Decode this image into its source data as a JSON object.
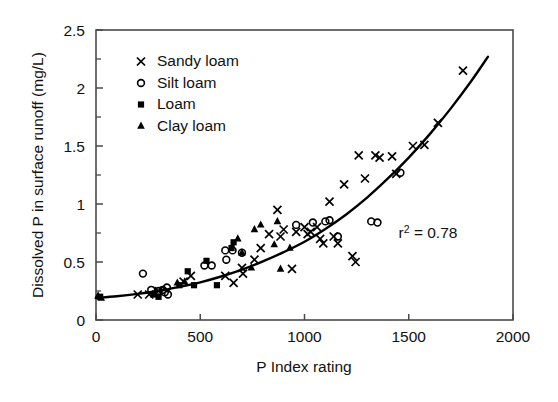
{
  "chart_data": {
    "type": "scatter",
    "title": "",
    "xlabel": "P Index rating",
    "ylabel": "Dissolved P in surface runoff (mg/L)",
    "xlim": [
      0,
      2000
    ],
    "ylim": [
      0,
      2.5
    ],
    "xticks": [
      0,
      500,
      1000,
      1500,
      2000
    ],
    "xtick_labels": [
      "0",
      "500",
      "1000",
      "1500",
      "2000"
    ],
    "yticks": [
      0,
      0.5,
      1,
      1.5,
      2,
      2.5
    ],
    "ytick_labels": [
      "0",
      "0.5",
      "1",
      "1.5",
      "2",
      "2.5"
    ],
    "yticks_minor": [
      0.25,
      0.75,
      1.25,
      1.75,
      2.25
    ],
    "grid": false,
    "legend_position": "upper-left-inside",
    "annotations": [
      {
        "text": "r2 = 0.78",
        "display": "r",
        "sup": "2",
        "rest": " = 0.78",
        "x": 1600,
        "y": 0.72
      }
    ],
    "series": [
      {
        "name": "Sandy loam",
        "marker": "cross",
        "points": [
          [
            200,
            0.22
          ],
          [
            255,
            0.22
          ],
          [
            300,
            0.25
          ],
          [
            420,
            0.33
          ],
          [
            455,
            0.38
          ],
          [
            620,
            0.38
          ],
          [
            660,
            0.32
          ],
          [
            700,
            0.45
          ],
          [
            705,
            0.4
          ],
          [
            760,
            0.52
          ],
          [
            790,
            0.62
          ],
          [
            830,
            0.74
          ],
          [
            870,
            0.95
          ],
          [
            885,
            0.72
          ],
          [
            900,
            0.78
          ],
          [
            960,
            0.76
          ],
          [
            1000,
            0.8
          ],
          [
            1015,
            0.74
          ],
          [
            1030,
            0.76
          ],
          [
            1060,
            0.8
          ],
          [
            1075,
            0.7
          ],
          [
            1090,
            0.66
          ],
          [
            1120,
            1.02
          ],
          [
            1140,
            0.72
          ],
          [
            1160,
            0.66
          ],
          [
            1190,
            1.17
          ],
          [
            1230,
            0.55
          ],
          [
            1245,
            0.5
          ],
          [
            1260,
            1.42
          ],
          [
            1290,
            1.22
          ],
          [
            1340,
            1.42
          ],
          [
            1360,
            1.4
          ],
          [
            1420,
            1.41
          ],
          [
            1440,
            1.26
          ],
          [
            1520,
            1.5
          ],
          [
            1575,
            1.51
          ],
          [
            1640,
            1.7
          ],
          [
            1760,
            2.15
          ],
          [
            940,
            0.44
          ]
        ]
      },
      {
        "name": "Silt loam",
        "marker": "circle",
        "points": [
          [
            225,
            0.4
          ],
          [
            265,
            0.26
          ],
          [
            300,
            0.25
          ],
          [
            320,
            0.26
          ],
          [
            330,
            0.24
          ],
          [
            340,
            0.28
          ],
          [
            345,
            0.22
          ],
          [
            520,
            0.47
          ],
          [
            555,
            0.47
          ],
          [
            620,
            0.6
          ],
          [
            625,
            0.52
          ],
          [
            655,
            0.6
          ],
          [
            700,
            0.58
          ],
          [
            960,
            0.82
          ],
          [
            1040,
            0.84
          ],
          [
            1100,
            0.85
          ],
          [
            1120,
            0.86
          ],
          [
            1160,
            0.72
          ],
          [
            1320,
            0.85
          ],
          [
            1350,
            0.84
          ],
          [
            1460,
            1.27
          ]
        ]
      },
      {
        "name": "Loam",
        "marker": "square",
        "points": [
          [
            20,
            0.2
          ],
          [
            275,
            0.22
          ],
          [
            300,
            0.2
          ],
          [
            400,
            0.3
          ],
          [
            440,
            0.42
          ],
          [
            470,
            0.3
          ],
          [
            530,
            0.51
          ],
          [
            580,
            0.3
          ],
          [
            650,
            0.62
          ],
          [
            660,
            0.67
          ]
        ]
      },
      {
        "name": "Clay loam",
        "marker": "triangle",
        "points": [
          [
            10,
            0.21
          ],
          [
            25,
            0.19
          ],
          [
            390,
            0.32
          ],
          [
            425,
            0.33
          ],
          [
            680,
            0.7
          ],
          [
            700,
            0.58
          ],
          [
            745,
            0.45
          ],
          [
            760,
            0.78
          ],
          [
            790,
            0.82
          ],
          [
            855,
            0.65
          ],
          [
            870,
            0.85
          ],
          [
            885,
            0.44
          ],
          [
            930,
            0.62
          ]
        ]
      }
    ],
    "fit_curve": {
      "name": "fitted exponential trend",
      "points": [
        [
          0,
          0.19
        ],
        [
          100,
          0.205
        ],
        [
          200,
          0.225
        ],
        [
          300,
          0.25
        ],
        [
          400,
          0.285
        ],
        [
          500,
          0.325
        ],
        [
          600,
          0.375
        ],
        [
          700,
          0.435
        ],
        [
          800,
          0.505
        ],
        [
          900,
          0.585
        ],
        [
          1000,
          0.675
        ],
        [
          1100,
          0.785
        ],
        [
          1200,
          0.91
        ],
        [
          1300,
          1.055
        ],
        [
          1400,
          1.22
        ],
        [
          1500,
          1.4
        ],
        [
          1600,
          1.6
        ],
        [
          1700,
          1.82
        ],
        [
          1800,
          2.06
        ],
        [
          1880,
          2.27
        ]
      ]
    }
  },
  "legend": {
    "items": [
      {
        "label": "Sandy loam",
        "marker": "cross"
      },
      {
        "label": "Silt loam",
        "marker": "circle"
      },
      {
        "label": "Loam",
        "marker": "square"
      },
      {
        "label": "Clay loam",
        "marker": "triangle"
      }
    ]
  }
}
